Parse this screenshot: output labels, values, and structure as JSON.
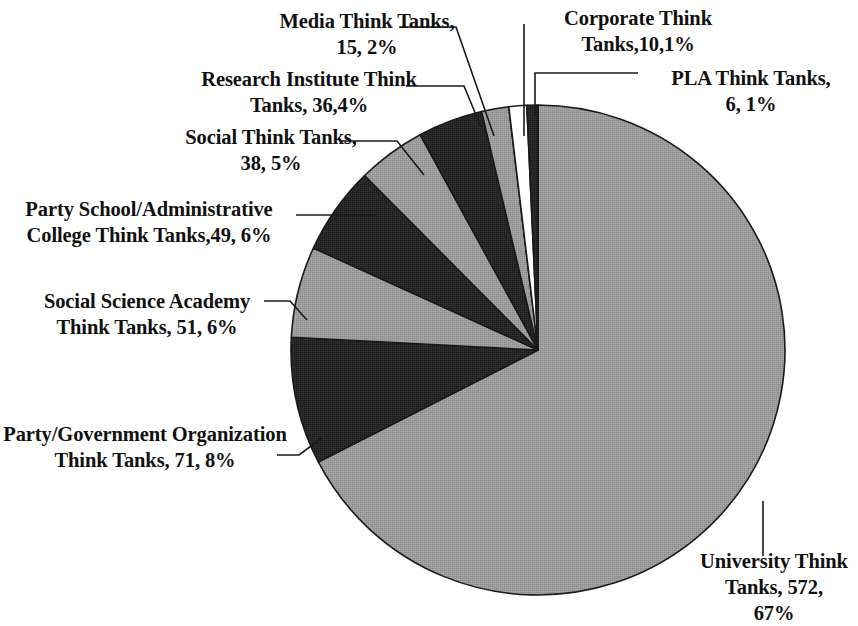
{
  "chart_data": {
    "type": "pie",
    "title": "",
    "total": 848,
    "legend": "none",
    "value_label_format": "{name}, {value}, {percent}%",
    "categories": [
      "University Think Tanks",
      "Party/Government Organization Think Tanks",
      "Social Science Academy Think Tanks",
      "Party School/Administrative College Think Tanks",
      "Social Think Tanks",
      "Research Institute Think Tanks",
      "Media Think Tanks",
      "Corporate Think Tanks",
      "PLA Think Tanks"
    ],
    "values": [
      572,
      71,
      51,
      49,
      38,
      36,
      15,
      10,
      6
    ],
    "percents": [
      67,
      8,
      6,
      6,
      5,
      4,
      2,
      1,
      1
    ],
    "slices": [
      {
        "name": "University Think Tanks",
        "value": 572,
        "percent": 67,
        "color": "#9b9b9b",
        "start_deg": 0,
        "end_deg": 242.8
      },
      {
        "name": "Party/Government Organization Think Tanks",
        "value": 71,
        "percent": 8,
        "color": "#262626",
        "start_deg": 242.8,
        "end_deg": 273.0
      },
      {
        "name": "Social Science Academy Think Tanks",
        "value": 51,
        "percent": 6,
        "color": "#9b9b9b",
        "start_deg": 273.0,
        "end_deg": 294.6
      },
      {
        "name": "Party School/Administrative College Think Tanks",
        "value": 49,
        "percent": 6,
        "color": "#262626",
        "start_deg": 294.6,
        "end_deg": 315.4
      },
      {
        "name": "Social Think Tanks",
        "value": 38,
        "percent": 5,
        "color": "#9b9b9b",
        "start_deg": 315.4,
        "end_deg": 331.5
      },
      {
        "name": "Research Institute Think Tanks",
        "value": 36,
        "percent": 4,
        "color": "#262626",
        "start_deg": 331.5,
        "end_deg": 346.8
      },
      {
        "name": "Media Think Tanks",
        "value": 15,
        "percent": 2,
        "color": "#9b9b9b",
        "start_deg": 346.8,
        "end_deg": 353.2
      },
      {
        "name": "Corporate Think Tanks",
        "value": 10,
        "percent": 1,
        "color": "#ffffff",
        "start_deg": 353.2,
        "end_deg": 357.4
      },
      {
        "name": "PLA Think Tanks",
        "value": 6,
        "percent": 1,
        "color": "#262626",
        "start_deg": 357.4,
        "end_deg": 360.0
      }
    ]
  },
  "labels": {
    "media": "Media Think Tanks,\n15, 2%",
    "research": "Research Institute Think\nTanks, 36,4%",
    "social": "Social Think Tanks,\n38, 5%",
    "party_school": "Party School/Administrative\nCollege Think Tanks,49, 6%",
    "social_science_academy": "Social Science Academy\nThink Tanks, 51, 6%",
    "party_government": "Party/Government Organization\nThink Tanks, 71, 8%",
    "corporate": "Corporate Think\nTanks,10,1%",
    "pla": "PLA Think Tanks,\n6, 1%",
    "university": "University Think\nTanks, 572,\n67%"
  },
  "geometry": {
    "center_x": 538,
    "center_y": 350,
    "radius_x": 247,
    "radius_y": 245,
    "outline_color": "#1a1a1a",
    "leader_color": "#1a1a1a"
  }
}
